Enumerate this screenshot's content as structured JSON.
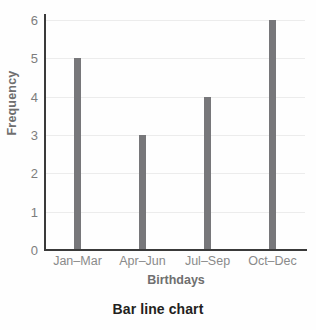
{
  "caption": "Bar line chart",
  "colors": {
    "bar": "#77777a",
    "gridline": "#ececec",
    "axis": "#3a3a3a",
    "tick_label": "#7d7d7d",
    "axis_title": "#6f6f6f",
    "caption": "#231f20",
    "background": "#fefefe"
  },
  "chart_data": {
    "type": "bar",
    "title": "Bar line chart",
    "xlabel": "Birthdays",
    "ylabel": "Frequency",
    "categories": [
      "Jan–Mar",
      "Apr–Jun",
      "Jul–Sep",
      "Oct–Dec"
    ],
    "values": [
      5,
      3,
      4,
      6
    ],
    "ylim": [
      0,
      6
    ],
    "yticks": [
      0,
      1,
      2,
      3,
      4,
      5,
      6
    ],
    "ytick_labels": [
      "0",
      "1",
      "2",
      "3",
      "4",
      "5",
      "6"
    ],
    "grid": true,
    "grid_axis": "y",
    "legend": false,
    "bar_style": "thin-line"
  }
}
